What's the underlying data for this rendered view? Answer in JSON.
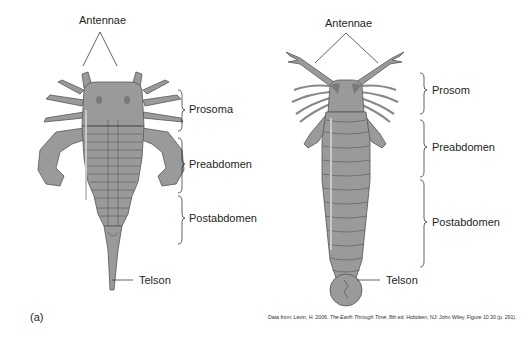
{
  "figure": {
    "panel_label": "(a)",
    "left_specimen": {
      "labels": {
        "antennae": "Antennae",
        "prosoma": "Prosoma",
        "preabdomen": "Preabdomen",
        "postabdomen": "Postabdomen",
        "telson": "Telson"
      }
    },
    "right_specimen": {
      "labels": {
        "antennae": "Antennae",
        "prosoma": "Prosom",
        "preabdomen": "Preabdomen",
        "postabdomen": "Postabdomen",
        "telson": "Telson"
      }
    },
    "caption": {
      "prefix": "Data from: Levin, H. 2006. ",
      "title": "The Earth Through Time",
      "suffix": ", 8th ed. Hoboken, NJ: John Wiley. Figure 10.30 (p. 291)."
    },
    "colors": {
      "body_fill": "#9a9a9a",
      "body_stroke": "#555555",
      "highlight": "#c8c8c8",
      "eye": "#7a7a7a",
      "line": "#231f20"
    }
  }
}
